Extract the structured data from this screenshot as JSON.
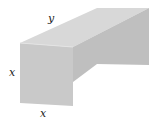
{
  "diagram": {
    "labels": {
      "top_edge": "y",
      "left_edge": "x",
      "bottom_edge": "x"
    },
    "colors": {
      "front_face": "#c9c9c9",
      "top_face": "#d8d8d8",
      "side_face": "#bdbdbd",
      "background": "#ffffff"
    }
  }
}
